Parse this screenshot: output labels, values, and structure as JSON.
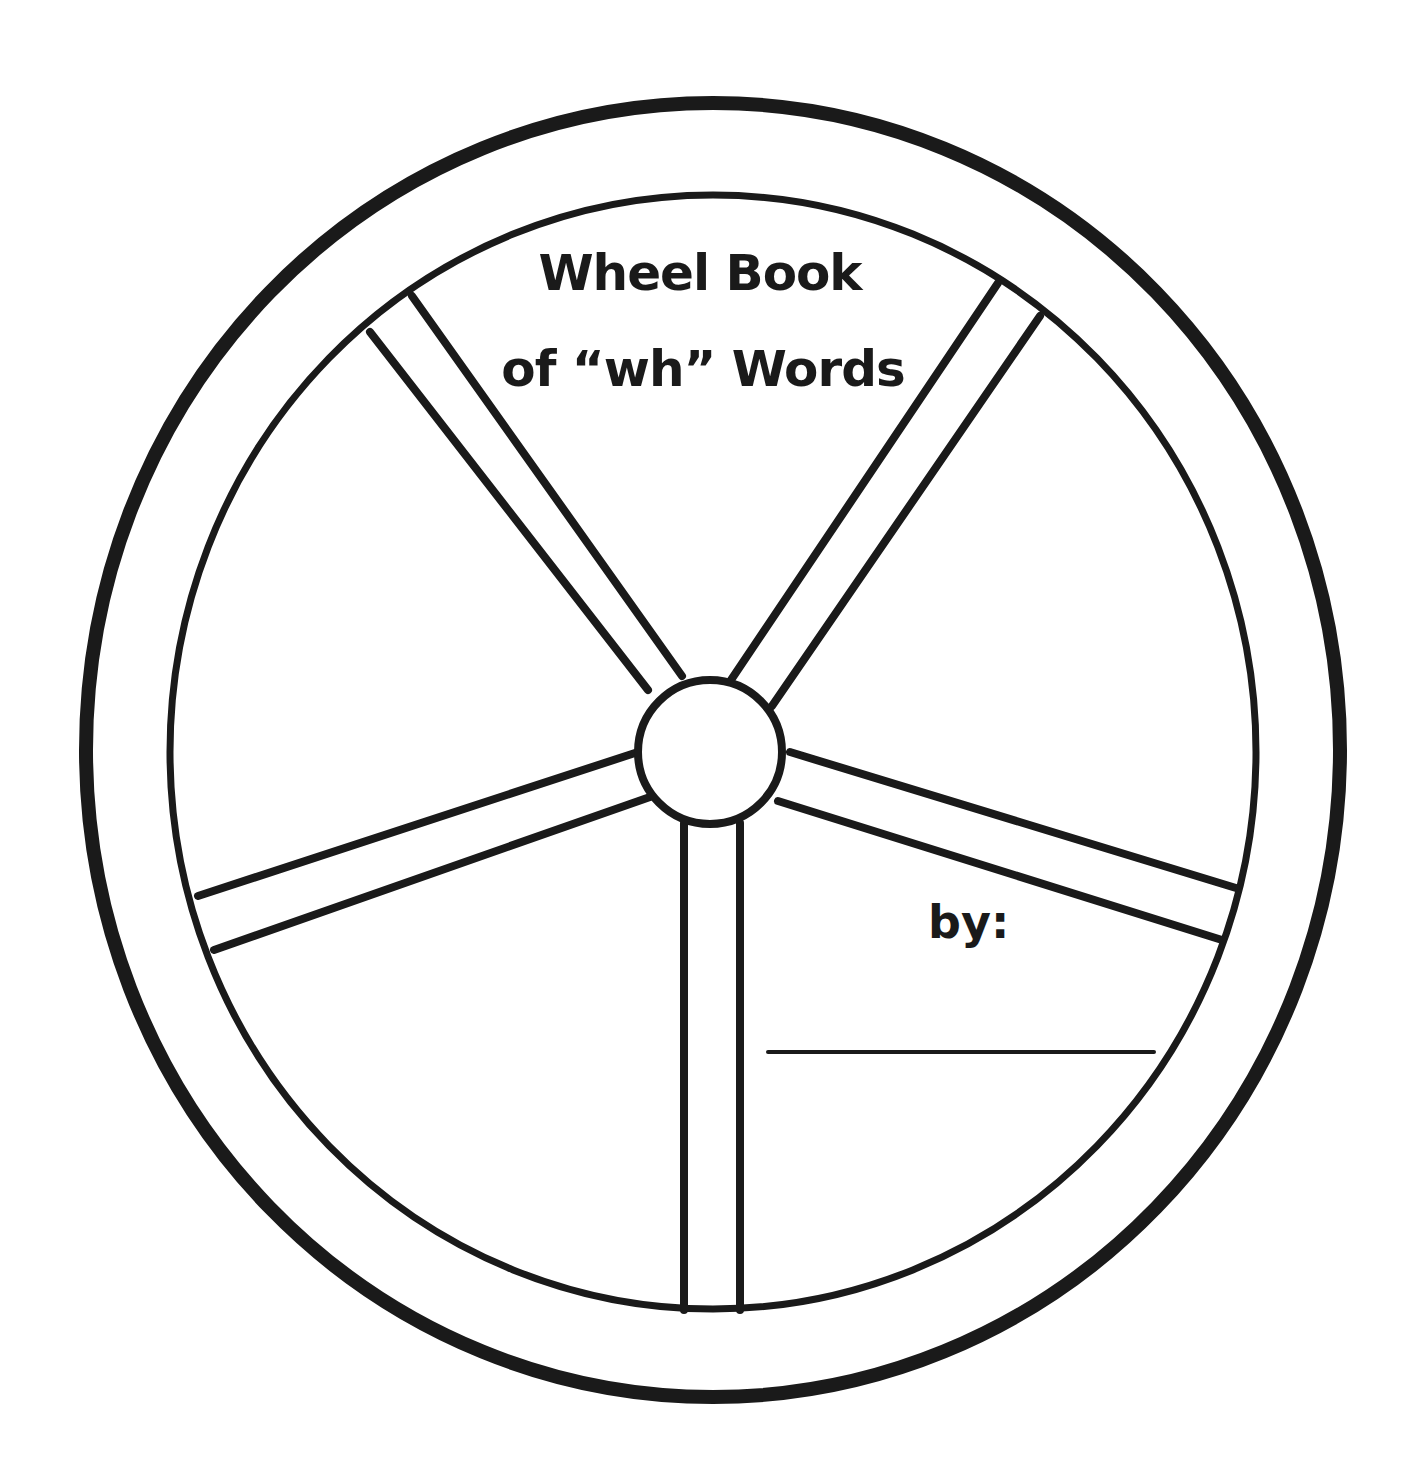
{
  "worksheet": {
    "title_line_1": "Wheel Book",
    "title_line_2": "of “wh” Words",
    "by_label": "by:",
    "name_field_value": ""
  },
  "colors": {
    "ink": "#1a1a1a",
    "paper": "#ffffff"
  },
  "wheel": {
    "spoke_count": 5,
    "sections": 5
  }
}
